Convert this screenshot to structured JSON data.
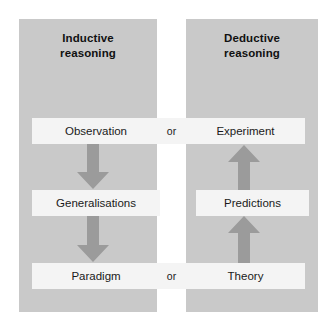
{
  "diagram": {
    "type": "flowchart",
    "columns": [
      {
        "id": "inductive",
        "heading": "Inductive\nreasoning",
        "direction": "downward"
      },
      {
        "id": "deductive",
        "heading": "Deductive\nreasoning",
        "direction": "upward"
      }
    ],
    "rows": [
      {
        "id": "row-top",
        "spans_both_columns": true,
        "left_label": "Observation",
        "connector_label": "or",
        "right_label": "Experiment"
      },
      {
        "id": "row-middle",
        "spans_both_columns": false,
        "left_label": "Generalisations",
        "connector_label": "",
        "right_label": "Predictions"
      },
      {
        "id": "row-bottom",
        "spans_both_columns": true,
        "left_label": "Paradigm",
        "connector_label": "or",
        "right_label": "Theory"
      }
    ],
    "arrows": [
      {
        "id": "observation-to-generalisations",
        "direction": "down",
        "column": "inductive"
      },
      {
        "id": "generalisations-to-paradigm",
        "direction": "down",
        "column": "inductive"
      },
      {
        "id": "predictions-to-experiment",
        "direction": "up",
        "column": "deductive"
      },
      {
        "id": "theory-to-predictions",
        "direction": "up",
        "column": "deductive"
      }
    ],
    "colors": {
      "background": "#ffffff",
      "column_fill": "#c9c9c9",
      "node_fill": "#f4f4f4",
      "arrow_fill": "#9b9b9b",
      "text": "#1a1a1a"
    }
  }
}
